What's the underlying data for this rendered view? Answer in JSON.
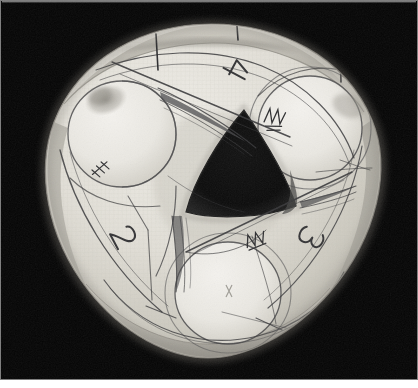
{
  "image": {
    "kind": "photograph",
    "subject": "rounded-triangular paper model with three circular disc cutouts and central triangular aperture",
    "width": 418,
    "height": 388,
    "background_color": "#050505",
    "border_color": "#7d7d7d",
    "bottom_strip_color": "#ffffff",
    "paper_light": "#e9e7e0",
    "paper_mid": "#d8d5cc",
    "paper_shadow": "#b4b1a8",
    "pencil_color": "#3a3a3c",
    "aperture_color": "#0a0a0a",
    "smudge_color": "#9a978f"
  },
  "annotations": {
    "labels": [
      {
        "id": "label-4",
        "text": "4",
        "x": 236,
        "y": 70,
        "rotation": 118,
        "size": 26
      },
      {
        "id": "label-2",
        "text": "2",
        "x": 124,
        "y": 237,
        "rotation": 62,
        "size": 26
      },
      {
        "id": "label-3",
        "text": "3",
        "x": 311,
        "y": 238,
        "rotation": 118,
        "size": 26
      }
    ],
    "tick_marks": [
      {
        "id": "tick-top-left",
        "x1": 156,
        "y1": 34,
        "x2": 157,
        "y2": 66
      },
      {
        "id": "tick-top-mid",
        "x1": 237,
        "y1": 26,
        "x2": 238,
        "y2": 38
      },
      {
        "id": "tick-top-right",
        "x1": 340,
        "y1": 47,
        "x2": 341,
        "y2": 81
      }
    ],
    "hatch_clusters": [
      {
        "id": "hatch-left",
        "x": 98,
        "y": 176,
        "rotation": -35
      },
      {
        "id": "hatch-upper-right",
        "x": 272,
        "y": 115,
        "rotation": 12
      },
      {
        "id": "hatch-lower-mid",
        "x": 252,
        "y": 243,
        "rotation": -20
      }
    ],
    "discs": [
      {
        "id": "disc-upper-left",
        "cx": 122,
        "cy": 134,
        "r": 54
      },
      {
        "id": "disc-upper-right",
        "cx": 310,
        "cy": 128,
        "r": 52
      },
      {
        "id": "disc-lower",
        "cx": 228,
        "cy": 293,
        "r": 53
      }
    ],
    "aperture": {
      "id": "central-aperture",
      "points": "243,112 293,206 188,212",
      "description": "dark curved-triangle hole at the centre"
    }
  },
  "caption": {
    "visible_text": ""
  }
}
